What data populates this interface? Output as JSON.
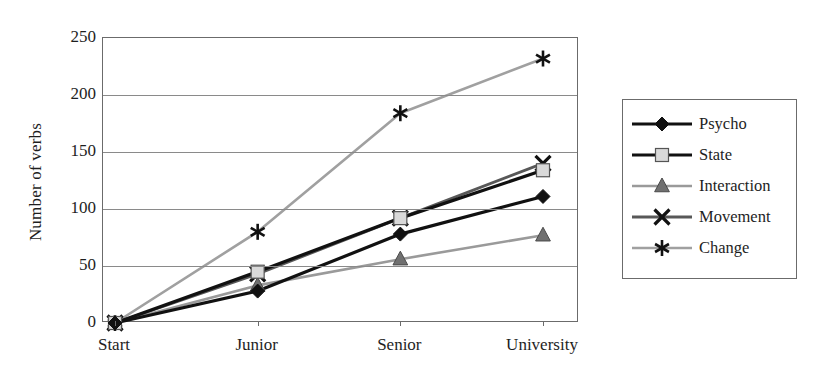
{
  "chart_data": {
    "type": "line",
    "title": "",
    "xlabel": "",
    "ylabel": "Number of verbs",
    "categories": [
      "Start",
      "Junior",
      "Senior",
      "University"
    ],
    "ylim": [
      0,
      250
    ],
    "yticks": [
      0,
      50,
      100,
      150,
      200,
      250
    ],
    "ytick_labels": [
      "0",
      "50",
      "100",
      "150",
      "200",
      "250"
    ],
    "grid": "horizontal",
    "legend_position": "right-outside",
    "series": [
      {
        "name": "Psycho",
        "values": [
          0,
          28,
          78,
          111
        ],
        "color": "#111111",
        "marker": "diamond",
        "marker_fill": "#111111",
        "line_width": 3.2
      },
      {
        "name": "State",
        "values": [
          0,
          45,
          92,
          134
        ],
        "color": "#111111",
        "marker": "square",
        "marker_fill": "#d9d9d9",
        "line_width": 3.2
      },
      {
        "name": "Interaction",
        "values": [
          0,
          33,
          56,
          77
        ],
        "color": "#9a9a9a",
        "marker": "triangle",
        "marker_fill": "#707070",
        "line_width": 2.6
      },
      {
        "name": "Movement",
        "values": [
          0,
          43,
          92,
          140
        ],
        "color": "#585858",
        "marker": "x",
        "marker_fill": "#111111",
        "line_width": 2.8
      },
      {
        "name": "Change",
        "values": [
          0,
          80,
          184,
          232
        ],
        "color": "#a0a0a0",
        "marker": "asterisk",
        "marker_fill": "#111111",
        "line_width": 2.6
      }
    ]
  },
  "axes": {
    "y_title": "Number of verbs",
    "frame_color": "#6b6b6b",
    "grid_color": "#8a8a8a"
  }
}
